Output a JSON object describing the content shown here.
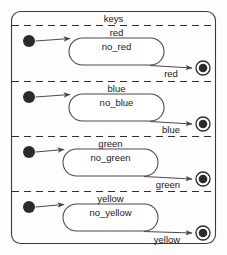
{
  "diagram": {
    "type": "uml-state-machine",
    "container_label": "keys",
    "colors": {
      "background": "#fdfdfd",
      "outline": "#3a3a3a",
      "separator": "#2e2e2e",
      "state_outline": "#4a4a4a",
      "node_fill": "#2b2b2b",
      "text": "#1a1a1a"
    },
    "regions": [
      {
        "state_name": "red",
        "substate_label": "no_red",
        "transition_label": "red",
        "initial_node": "initial-state-node",
        "final_node": "final-state-node"
      },
      {
        "state_name": "blue",
        "substate_label": "no_blue",
        "transition_label": "blue",
        "initial_node": "initial-state-node",
        "final_node": "final-state-node"
      },
      {
        "state_name": "green",
        "substate_label": "no_green",
        "transition_label": "green",
        "initial_node": "initial-state-node",
        "final_node": "final-state-node"
      },
      {
        "state_name": "yellow",
        "substate_label": "no_yellow",
        "transition_label": "yellow",
        "initial_node": "initial-state-node",
        "final_node": "final-state-node"
      }
    ]
  }
}
